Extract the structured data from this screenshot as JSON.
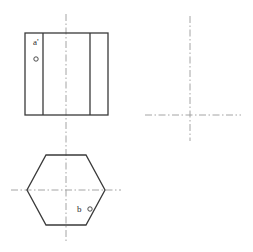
{
  "drawing": {
    "type": "orthographic-projection",
    "title": "",
    "background_color": "#ffffff",
    "outline_color": "#3a3a3a",
    "centerline_color": "#9a9a9a",
    "text_color": "#2b2b2b",
    "front_view": {
      "name": "front-view-rectangle",
      "shape": "rectangle",
      "x": 25,
      "y": 33,
      "width": 83,
      "height": 82,
      "internal_vertical_lines": [
        43,
        90
      ],
      "point_label": "a'",
      "point_label_x": 33,
      "point_label_y": 45,
      "point_marker_x": 36,
      "point_marker_y": 59,
      "point_marker_radius": 2.2
    },
    "top_view": {
      "name": "top-view-hexagon",
      "shape": "hexagon",
      "center_x": 66,
      "center_y": 190,
      "radius_x": 39,
      "radius_y": 35,
      "flat_top_half_width": 20,
      "point_label": "b",
      "point_label_x": 77,
      "point_label_y": 212,
      "point_marker_x": 90,
      "point_marker_y": 209,
      "point_marker_radius": 2.2
    },
    "centerlines": [
      {
        "name": "vertical-centerline-main",
        "orientation": "vertical",
        "x": 66,
        "y1": 14,
        "y2": 241
      },
      {
        "name": "horizontal-centerline-top-view",
        "orientation": "horizontal",
        "y": 190,
        "x1": 11,
        "x2": 121
      },
      {
        "name": "vertical-centerline-side",
        "orientation": "vertical",
        "x": 190,
        "y1": 16,
        "y2": 141
      },
      {
        "name": "horizontal-centerline-side",
        "orientation": "horizontal",
        "y": 115,
        "x1": 145,
        "x2": 241
      }
    ]
  }
}
